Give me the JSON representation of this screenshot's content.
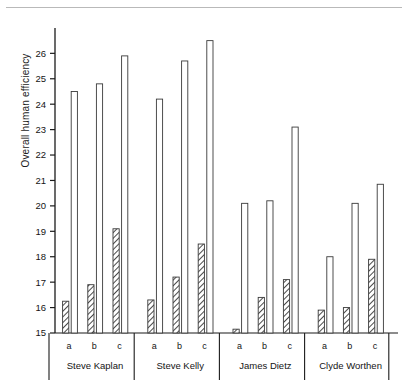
{
  "figure": {
    "y_axis_title": "Overall human efficiency",
    "top_rule": true
  },
  "axis": {
    "ticks": [
      15,
      16,
      17,
      18,
      19,
      20,
      21,
      22,
      23,
      24,
      25,
      26
    ],
    "tick_labels": [
      "15",
      "16",
      "17",
      "18",
      "19",
      "20",
      "21",
      "22",
      "23",
      "24",
      "25",
      "26"
    ]
  },
  "subcategories": [
    "a",
    "b",
    "c"
  ],
  "groups": [
    "Steve Kaplan",
    "Steve Kelly",
    "James Dietz",
    "Clyde Worthen"
  ],
  "series_names": [
    "hatched",
    "open"
  ],
  "chart_data": {
    "type": "bar",
    "title": "",
    "subtitle": "",
    "xlabel": "",
    "ylabel": "Overall human efficiency",
    "ylim": [
      15,
      26.8
    ],
    "yticks": [
      15,
      16,
      17,
      18,
      19,
      20,
      21,
      22,
      23,
      24,
      25,
      26
    ],
    "grid": false,
    "legend": "none",
    "baseline": 15,
    "categories": [
      "Steve Kaplan a",
      "Steve Kaplan b",
      "Steve Kaplan c",
      "Steve Kelly a",
      "Steve Kelly b",
      "Steve Kelly c",
      "James Dietz a",
      "James Dietz b",
      "James Dietz c",
      "Clyde Worthen a",
      "Clyde Worthen b",
      "Clyde Worthen c"
    ],
    "series": [
      {
        "name": "hatched",
        "style": "diagonal-hatch",
        "values": [
          16.25,
          16.9,
          19.1,
          16.3,
          17.2,
          18.5,
          15.15,
          16.4,
          17.1,
          15.9,
          16.0,
          17.9
        ]
      },
      {
        "name": "open",
        "style": "white-outline",
        "values": [
          24.5,
          24.8,
          25.9,
          24.2,
          25.7,
          26.5,
          20.1,
          20.2,
          23.1,
          18.0,
          20.1,
          20.85
        ]
      }
    ],
    "groups": [
      {
        "label": "Steve Kaplan",
        "points": [
          {
            "sub": "a",
            "hatched": 16.25,
            "open": 24.5
          },
          {
            "sub": "b",
            "hatched": 16.9,
            "open": 24.8
          },
          {
            "sub": "c",
            "hatched": 19.1,
            "open": 25.9
          }
        ]
      },
      {
        "label": "Steve Kelly",
        "points": [
          {
            "sub": "a",
            "hatched": 16.3,
            "open": 24.2
          },
          {
            "sub": "b",
            "hatched": 17.2,
            "open": 25.7
          },
          {
            "sub": "c",
            "hatched": 18.5,
            "open": 26.5
          }
        ]
      },
      {
        "label": "James Dietz",
        "points": [
          {
            "sub": "a",
            "hatched": 15.15,
            "open": 20.1
          },
          {
            "sub": "b",
            "hatched": 16.4,
            "open": 20.2
          },
          {
            "sub": "c",
            "hatched": 17.1,
            "open": 23.1
          }
        ]
      },
      {
        "label": "Clyde Worthen",
        "points": [
          {
            "sub": "a",
            "hatched": 15.9,
            "open": 18.0
          },
          {
            "sub": "b",
            "hatched": 16.0,
            "open": 20.1
          },
          {
            "sub": "c",
            "hatched": 17.9,
            "open": 20.85
          }
        ]
      }
    ]
  },
  "colors": {
    "axis": "#1b1b1b",
    "bar_outline": "#3a3a3a",
    "bar_fill": "#ffffff",
    "hatch": "#555555",
    "rule": "#b9b9b9"
  }
}
